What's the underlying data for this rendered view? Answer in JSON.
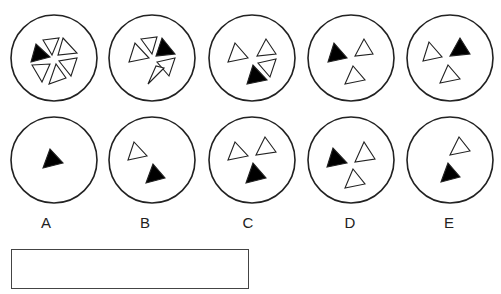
{
  "colors": {
    "stroke": "#222222",
    "fill_black": "#000000",
    "fill_white": "#ffffff"
  },
  "circle_radius": 43,
  "top_row": [
    {
      "cx": 54,
      "cy": 58,
      "triangles": [
        {
          "fill": "black",
          "points": "36,44 31,62 50,57"
        },
        {
          "fill": "white",
          "points": "43,40 59,38 52,55"
        },
        {
          "fill": "white",
          "points": "63,38 77,53 58,55"
        },
        {
          "fill": "white",
          "points": "77,58 71,76 59,61"
        },
        {
          "fill": "white",
          "points": "66,78 49,84 56,64"
        },
        {
          "fill": "white",
          "points": "32,65 50,64 42,82"
        }
      ]
    },
    {
      "cx": 152,
      "cy": 58,
      "triangles": [
        {
          "fill": "white",
          "points": "135,43 129,62 149,58"
        },
        {
          "fill": "white",
          "points": "141,39 157,37 152,54"
        },
        {
          "fill": "black",
          "points": "162,38 175,54 156,56"
        },
        {
          "fill": "white",
          "points": "175,58 169,76 157,62"
        },
        {
          "fill": "white",
          "points": "164,68 148,84 156,66"
        }
      ]
    },
    {
      "cx": 252,
      "cy": 58,
      "triangles": [
        {
          "fill": "white",
          "points": "235,43 228,62 248,58"
        },
        {
          "fill": "white",
          "points": "266,39 257,56 276,54"
        },
        {
          "fill": "white",
          "points": "276,59 270,77 258,63"
        },
        {
          "fill": "black",
          "points": "253,65 247,84 267,80"
        }
      ]
    },
    {
      "cx": 351,
      "cy": 58,
      "triangles": [
        {
          "fill": "black",
          "points": "334,43 328,62 347,58"
        },
        {
          "fill": "white",
          "points": "364,39 355,56 373,54"
        },
        {
          "fill": "white",
          "points": "353,66 345,84 365,80"
        }
      ]
    },
    {
      "cx": 450,
      "cy": 58,
      "triangles": [
        {
          "fill": "white",
          "points": "429,42 423,61 442,57"
        },
        {
          "fill": "black",
          "points": "460,38 450,56 470,54"
        },
        {
          "fill": "white",
          "points": "448,65 440,83 460,79"
        }
      ]
    }
  ],
  "bottom_row": [
    {
      "cx": 54,
      "cy": 160,
      "triangles": [
        {
          "fill": "black",
          "points": "50,149 43,168 63,163"
        }
      ]
    },
    {
      "cx": 152,
      "cy": 160,
      "triangles": [
        {
          "fill": "white",
          "points": "134,142 128,160 147,156"
        },
        {
          "fill": "black",
          "points": "153,164 146,183 165,178"
        }
      ]
    },
    {
      "cx": 252,
      "cy": 160,
      "triangles": [
        {
          "fill": "white",
          "points": "235,142 228,160 248,156"
        },
        {
          "fill": "white",
          "points": "265,137 256,155 276,152"
        },
        {
          "fill": "black",
          "points": "253,163 246,183 266,178"
        }
      ]
    },
    {
      "cx": 351,
      "cy": 160,
      "triangles": [
        {
          "fill": "black",
          "points": "333,148 327,167 347,163"
        },
        {
          "fill": "white",
          "points": "364,142 355,162 375,159"
        },
        {
          "fill": "white",
          "points": "353,169 345,188 365,184"
        }
      ]
    },
    {
      "cx": 450,
      "cy": 160,
      "triangles": [
        {
          "fill": "white",
          "points": "459,137 450,155 470,151"
        },
        {
          "fill": "black",
          "points": "448,163 441,182 460,177"
        }
      ]
    }
  ],
  "labels": [
    {
      "text": "A",
      "x": 46
    },
    {
      "text": "B",
      "x": 145
    },
    {
      "text": "C",
      "x": 248
    },
    {
      "text": "D",
      "x": 350
    },
    {
      "text": "E",
      "x": 449
    }
  ],
  "answer_box": {
    "value": ""
  }
}
